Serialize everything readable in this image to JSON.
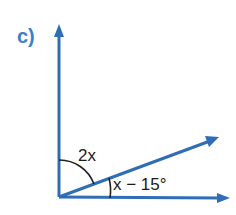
{
  "diagram": {
    "part_label": "c)",
    "angle_upper_label": "2x",
    "angle_lower_label": "x − 15°",
    "colors": {
      "ray": "#2f6db5",
      "label_part": "#3b7fd0",
      "arc": "#222222",
      "text": "#1a1a1a"
    },
    "rays": [
      {
        "name": "vertical-ray",
        "direction": "up"
      },
      {
        "name": "diagonal-ray",
        "direction": "up-right"
      },
      {
        "name": "horizontal-ray",
        "direction": "right"
      }
    ]
  }
}
